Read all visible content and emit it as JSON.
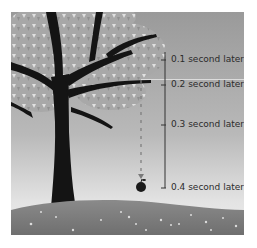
{
  "diagram": {
    "labels": [
      {
        "text": "0.1 second later"
      },
      {
        "text": "0.2 second later"
      },
      {
        "text": "0.3 second later"
      },
      {
        "text": "0.4 second later"
      }
    ],
    "colors": {
      "sky_top": "#9a9a9a",
      "sky_bottom": "#e6e6e6",
      "ground": "#7d7d7d",
      "tree": "#141414",
      "leaves": "#b5b5b5",
      "bracket": "#333333",
      "text": "#2b2b2b"
    }
  }
}
